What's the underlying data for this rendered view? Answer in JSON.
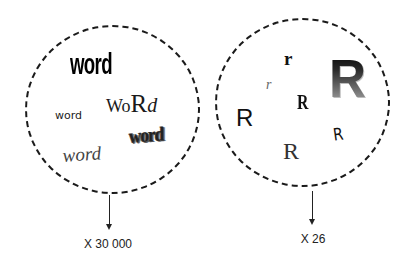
{
  "left_group": {
    "words": [
      {
        "text": "word",
        "style": "bold condensed"
      },
      {
        "text": "word",
        "style": "plain sans-serif"
      },
      {
        "parts": [
          "W",
          "o",
          "R",
          "d"
        ],
        "style": "mixed-case serif"
      },
      {
        "text": "word",
        "style": "distorted shadowed"
      },
      {
        "text": "word",
        "style": "italic serif"
      }
    ],
    "multiplier_label": "X 30 000"
  },
  "right_group": {
    "glyphs": [
      {
        "text": "r",
        "style": "bold serif lowercase"
      },
      {
        "text": "r",
        "style": "small italic lowercase"
      },
      {
        "text": "R",
        "style": "bold condensed serif"
      },
      {
        "text": "R",
        "style": "sans-serif"
      },
      {
        "text": "R",
        "style": "serif"
      },
      {
        "text": "R",
        "style": "handwritten"
      },
      {
        "text": "R",
        "style": "large gradient bevel"
      }
    ],
    "multiplier_label": "X 26"
  },
  "colors": {
    "background": "#ffffff",
    "stroke": "#1a1a1a",
    "text": "#222222"
  }
}
